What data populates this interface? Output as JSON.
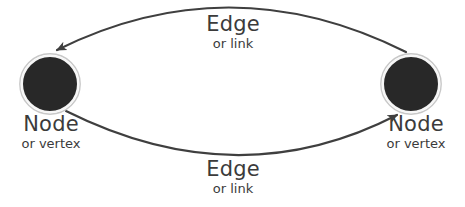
{
  "diagram": {
    "background": "#ffffff",
    "edge_color": "#3f3f3f",
    "node_fill": "#282828",
    "node_ring": "#c8c8c8",
    "text_color": "#3b3b3b",
    "top_edge": {
      "label": "Edge",
      "sublabel": "or link"
    },
    "bottom_edge": {
      "label": "Edge",
      "sublabel": "or link"
    },
    "left_node": {
      "label": "Node",
      "sublabel": "or vertex"
    },
    "right_node": {
      "label": "Node",
      "sublabel": "or vertex"
    }
  }
}
